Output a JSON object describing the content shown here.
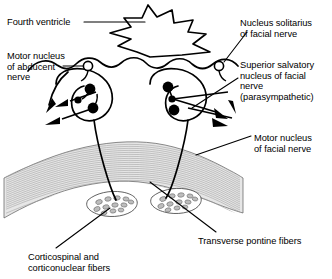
{
  "figure": {
    "background_color": "#ffffff",
    "stroke_color": "#000000",
    "pons_fill_color": "#e3e3e3",
    "pons_fiber_color": "#9a9a9a",
    "bundle_fill_color": "#c9c9c9",
    "neuron_color": "#000000"
  },
  "labels": {
    "fourth_ventricle": {
      "lines": [
        "Fourth ventricle"
      ],
      "x": 7,
      "y": 17
    },
    "motor_nucleus_abducent": {
      "lines": [
        "Motor nucleus",
        "of abducent",
        "nerve"
      ],
      "x": 7,
      "y": 51
    },
    "nucleus_solitarius": {
      "lines": [
        "Nucleus solitarius",
        "of facial nerve"
      ],
      "x": 240,
      "y": 18
    },
    "superior_salvatory": {
      "lines": [
        "Superior salvatory",
        "nucleus of facial",
        "nerve",
        "(parasympathetic)"
      ],
      "x": 240,
      "y": 60
    },
    "motor_nucleus_facial": {
      "lines": [
        "Motor nucleus",
        "of facial nerve"
      ],
      "x": 254,
      "y": 133
    },
    "transverse_pontine_fibers": {
      "lines": [
        "Transverse pontine fibers"
      ],
      "x": 198,
      "y": 236
    },
    "corticospinal_corticonuclear": {
      "lines": [
        "Corticospinal and",
        "corticonuclear fibers"
      ],
      "x": 28,
      "y": 252
    }
  },
  "structures": {
    "fourth_ventricle_name": "fourth-ventricle",
    "pons_name": "pons-body",
    "left_nucleus_group": "left-nucleus-cluster",
    "right_nucleus_group": "right-nucleus-cluster",
    "left_fiber_bundle": "left-corticospinal-bundle",
    "right_fiber_bundle": "right-corticospinal-bundle",
    "abducent_marker": "motor-nucleus-abducent-marker",
    "solitarius_marker": "nucleus-solitarius-marker"
  }
}
